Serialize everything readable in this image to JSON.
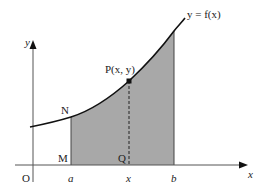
{
  "diagram": {
    "curve_label": "y = f(x)",
    "point_label": "P(x, y)",
    "axes": {
      "x_label": "x",
      "y_label": "y",
      "origin_label": "O"
    },
    "points": {
      "N": "N",
      "M": "M",
      "Q": "Q"
    },
    "ticks": {
      "a": "a",
      "x": "x",
      "b": "b"
    },
    "colors": {
      "shade": "#a8a8a8",
      "line": "#222222"
    }
  }
}
